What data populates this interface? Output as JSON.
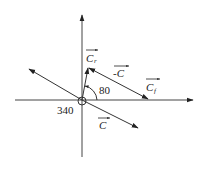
{
  "diagram": {
    "type": "vector-diagram",
    "colors": {
      "line": "#333333",
      "text": "#222222",
      "background": "#ffffff"
    },
    "origin": {
      "x": 82,
      "y": 100
    },
    "vectors": [
      {
        "id": "C_r",
        "label": "C",
        "subscript": "r",
        "has_arrow_over": true
      },
      {
        "id": "neg_C",
        "label": "-C",
        "has_arrow_over": true
      },
      {
        "id": "C_f",
        "label": "C",
        "subscript": "f",
        "has_arrow_over": true
      },
      {
        "id": "C",
        "label": "C",
        "has_arrow_over": true
      }
    ],
    "angles": [
      {
        "label": "80"
      },
      {
        "label": "340"
      }
    ]
  }
}
